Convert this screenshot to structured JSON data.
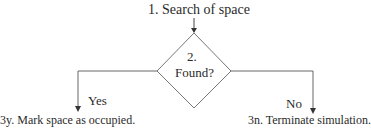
{
  "diagram": {
    "type": "flowchart",
    "nodes": {
      "start": {
        "label": "1. Search of space"
      },
      "decision": {
        "number": "2.",
        "label": "Found?"
      },
      "yes_result": {
        "label": "3y. Mark space as occupied."
      },
      "no_result": {
        "label": "3n. Terminate simulation."
      }
    },
    "edges": {
      "yes_label": "Yes",
      "no_label": "No"
    },
    "colors": {
      "line": "#555555",
      "text": "#2a2a2a",
      "background": "#ffffff"
    }
  }
}
